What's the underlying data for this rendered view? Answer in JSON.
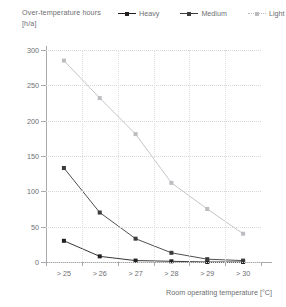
{
  "header": {
    "title": "Over-temperature hours\n[h/a]"
  },
  "legend": {
    "position": "top-right",
    "items": [
      {
        "label": "Heavy",
        "color": "#231f20",
        "style": "solid"
      },
      {
        "label": "Medium",
        "color": "#3b3b3d",
        "style": "solid"
      },
      {
        "label": "Light",
        "color": "#bcbdc0",
        "style": "dotted"
      }
    ]
  },
  "axis": {
    "x_title": "Room operating temperature [°C]",
    "y_ticks": [
      "300",
      "250",
      "200",
      "150",
      "100",
      "50",
      "0"
    ],
    "x_ticks": [
      "> 25",
      "> 26",
      "> 27",
      "> 28",
      "> 29",
      "> 30"
    ]
  },
  "chart_data": {
    "type": "line",
    "title": "Over-temperature hours [h/a]",
    "xlabel": "Room operating temperature [°C]",
    "ylabel": "Over-temperature hours [h/a]",
    "categories": [
      "> 25",
      "> 26",
      "> 27",
      "> 28",
      "> 29",
      "> 30"
    ],
    "ylim": [
      0,
      300
    ],
    "yticks": [
      0,
      50,
      100,
      150,
      200,
      250,
      300
    ],
    "grid": true,
    "legend_position": "top-right",
    "series": [
      {
        "name": "Heavy",
        "color": "#231f20",
        "marker": "square",
        "values": [
          30,
          8,
          2,
          1,
          0,
          0
        ]
      },
      {
        "name": "Medium",
        "color": "#3b3b3d",
        "marker": "square",
        "values": [
          133,
          70,
          33,
          13,
          4,
          2
        ]
      },
      {
        "name": "Light",
        "color": "#bcbdc0",
        "marker": "square",
        "values": [
          285,
          232,
          181,
          112,
          75,
          40
        ]
      }
    ]
  }
}
